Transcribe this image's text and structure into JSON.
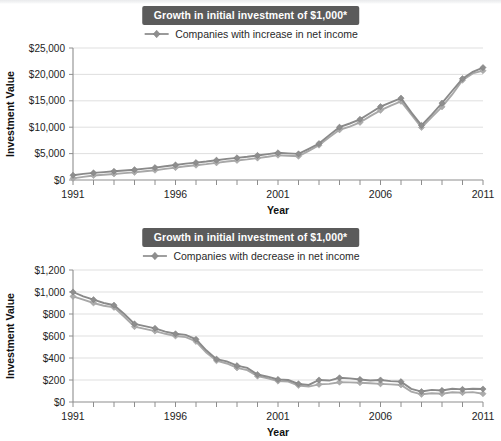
{
  "chart_data": [
    {
      "id": "chart-increase",
      "type": "line",
      "title": "Growth in initial investment of $1,000*",
      "xlabel": "Year",
      "ylabel": "Investment Value",
      "legend": [
        "Companies with increase in net income"
      ],
      "legend_position": "top-center",
      "grid": true,
      "ylim": [
        0,
        25000
      ],
      "ytick_values": [
        0,
        5000,
        10000,
        15000,
        20000,
        25000
      ],
      "ytick_labels": [
        "$0",
        "$5,000",
        "$10,000",
        "$15,000",
        "$20,000",
        "$25,000"
      ],
      "xlim": [
        1991,
        2011
      ],
      "xtick_values": [
        1991,
        1996,
        2001,
        2006,
        2011
      ],
      "xtick_labels": [
        "1991",
        "1996",
        "2001",
        "2006",
        "2011"
      ],
      "x": [
        1991,
        1991.5,
        1992,
        1992.5,
        1993,
        1993.5,
        1994,
        1994.5,
        1995,
        1995.5,
        1996,
        1996.5,
        1997,
        1997.5,
        1998,
        1998.5,
        1999,
        1999.5,
        2000,
        2000.5,
        2001,
        2001.5,
        2002,
        2002.5,
        2003,
        2003.5,
        2004,
        2004.5,
        2005,
        2005.5,
        2006,
        2006.5,
        2007,
        2007.5,
        2008,
        2008.5,
        2009,
        2009.5,
        2010,
        2010.5,
        2011
      ],
      "series": [
        {
          "name": "Series upper",
          "values": [
            900,
            1150,
            1350,
            1500,
            1650,
            1800,
            1950,
            2150,
            2350,
            2600,
            2850,
            3100,
            3300,
            3500,
            3750,
            4000,
            4200,
            4400,
            4650,
            4900,
            5150,
            5050,
            4950,
            5900,
            6900,
            8500,
            10000,
            10700,
            11500,
            12700,
            13900,
            14700,
            15500,
            12800,
            10350,
            12400,
            14550,
            16900,
            19200,
            20500,
            21300
          ]
        },
        {
          "name": "Series lower",
          "values": [
            300,
            600,
            850,
            1000,
            1150,
            1300,
            1450,
            1650,
            1850,
            2100,
            2350,
            2600,
            2800,
            3000,
            3250,
            3500,
            3700,
            3900,
            4150,
            4400,
            4700,
            4600,
            4500,
            5500,
            6600,
            8100,
            9500,
            10100,
            10900,
            12100,
            13200,
            14100,
            14900,
            12400,
            9950,
            11900,
            13850,
            16200,
            18900,
            20200,
            20700
          ]
        }
      ]
    },
    {
      "id": "chart-decrease",
      "type": "line",
      "title": "Growth in initial investment of $1,000*",
      "xlabel": "Year",
      "ylabel": "Investment Value",
      "legend": [
        "Companies with decrease in net income"
      ],
      "legend_position": "top-center",
      "grid": true,
      "ylim": [
        0,
        1200
      ],
      "ytick_values": [
        0,
        200,
        400,
        600,
        800,
        1000,
        1200
      ],
      "ytick_labels": [
        "$0",
        "$200",
        "$400",
        "$600",
        "$800",
        "$1,000",
        "$1,200"
      ],
      "xlim": [
        1991,
        2011
      ],
      "xtick_values": [
        1991,
        1996,
        2001,
        2006,
        2011
      ],
      "xtick_labels": [
        "1991",
        "1996",
        "2001",
        "2006",
        "2011"
      ],
      "x": [
        1991,
        1991.5,
        1992,
        1992.5,
        1993,
        1993.5,
        1994,
        1994.5,
        1995,
        1995.5,
        1996,
        1996.5,
        1997,
        1997.5,
        1998,
        1998.5,
        1999,
        1999.5,
        2000,
        2000.5,
        2001,
        2001.5,
        2002,
        2002.5,
        2003,
        2003.5,
        2004,
        2004.5,
        2005,
        2005.5,
        2006,
        2006.5,
        2007,
        2007.5,
        2008,
        2008.5,
        2009,
        2009.5,
        2010,
        2010.5,
        2011
      ],
      "series": [
        {
          "name": "Series upper",
          "values": [
            1000,
            960,
            930,
            900,
            880,
            800,
            710,
            690,
            670,
            640,
            620,
            610,
            570,
            470,
            390,
            370,
            330,
            310,
            250,
            230,
            205,
            200,
            165,
            155,
            200,
            195,
            220,
            215,
            205,
            195,
            200,
            190,
            185,
            120,
            95,
            110,
            105,
            120,
            115,
            120,
            118
          ]
        },
        {
          "name": "Series lower",
          "values": [
            960,
            930,
            900,
            875,
            860,
            775,
            685,
            665,
            645,
            620,
            600,
            590,
            550,
            450,
            375,
            350,
            310,
            290,
            235,
            215,
            190,
            185,
            150,
            140,
            160,
            165,
            180,
            178,
            175,
            170,
            165,
            160,
            155,
            95,
            70,
            80,
            75,
            88,
            85,
            90,
            75
          ]
        }
      ]
    }
  ]
}
